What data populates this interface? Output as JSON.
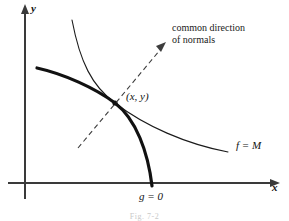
{
  "figure": {
    "type": "diagram",
    "caption": "Fig. 7-2",
    "axes": {
      "x_label": "x",
      "y_label": "y"
    },
    "labels": {
      "point": "(x, y)",
      "curve_f": "f = M",
      "curve_g": "g = 0",
      "normals_line1": "common direction",
      "normals_line2": "of normals"
    },
    "colors": {
      "ink": "#111111",
      "background": "#ffffff",
      "axis": "#444444",
      "caption": "#c9c9c9"
    },
    "geometry": {
      "axis_origin": [
        25,
        183
      ],
      "tangency_point": [
        115,
        103
      ],
      "curve_g_start": [
        37,
        68
      ],
      "curve_g_end": [
        152,
        186
      ],
      "curve_f_start": [
        72,
        20
      ],
      "curve_f_end": [
        228,
        152
      ],
      "normal_arrow_start": [
        78,
        148
      ],
      "normal_arrow_end": [
        164,
        45
      ]
    }
  }
}
